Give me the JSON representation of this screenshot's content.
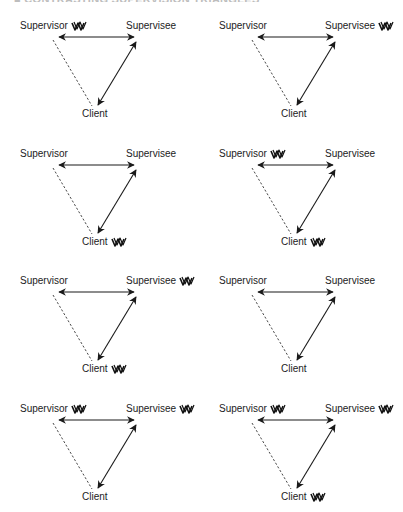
{
  "page": {
    "heading_clipped": "■ CONTRASTING SUPERVISION TRIANGLES"
  },
  "nodes": {
    "supervisor": "Supervisor",
    "supervisee": "Supervisee",
    "client": "Client"
  },
  "legend": {
    "mark_icon": "tension-zigzag-icon",
    "solid_edge": "double-headed arrow (direct relationship)",
    "dashed_edge": "dashed line (indirect relationship)"
  },
  "diagrams": [
    {
      "id": 1,
      "row": 1,
      "col": 1,
      "marked": {
        "supervisor": true,
        "supervisee": false,
        "client": false
      }
    },
    {
      "id": 2,
      "row": 1,
      "col": 2,
      "marked": {
        "supervisor": false,
        "supervisee": true,
        "client": false
      }
    },
    {
      "id": 3,
      "row": 2,
      "col": 1,
      "marked": {
        "supervisor": false,
        "supervisee": false,
        "client": true
      }
    },
    {
      "id": 4,
      "row": 2,
      "col": 2,
      "marked": {
        "supervisor": true,
        "supervisee": false,
        "client": true
      }
    },
    {
      "id": 5,
      "row": 3,
      "col": 1,
      "marked": {
        "supervisor": false,
        "supervisee": true,
        "client": true
      }
    },
    {
      "id": 6,
      "row": 3,
      "col": 2,
      "marked": {
        "supervisor": false,
        "supervisee": false,
        "client": false
      }
    },
    {
      "id": 7,
      "row": 4,
      "col": 1,
      "marked": {
        "supervisor": true,
        "supervisee": true,
        "client": false
      }
    },
    {
      "id": 8,
      "row": 4,
      "col": 2,
      "marked": {
        "supervisor": true,
        "supervisee": true,
        "client": true
      }
    }
  ],
  "layout": {
    "col_x": [
      10,
      209
    ],
    "row_y": [
      15,
      143,
      270,
      398
    ]
  }
}
